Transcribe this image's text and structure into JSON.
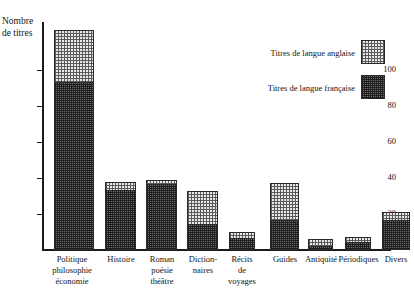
{
  "page": {
    "title_remnant": "· ·· ·· ··"
  },
  "axis_title": {
    "line1": "Nombre",
    "line2": "de titres"
  },
  "legend": {
    "items": [
      {
        "label": "Titres de langue anglaise",
        "key": "english",
        "pattern": "light-checker"
      },
      {
        "label": "Titres de langue française",
        "key": "french",
        "pattern": "dark-crosshatch"
      }
    ]
  },
  "chart_data": {
    "type": "bar",
    "stacked": true,
    "title": "",
    "xlabel": "",
    "ylabel": "Nombre de titres",
    "ylim": [
      0,
      130
    ],
    "yticks": [
      20,
      40,
      60,
      80,
      100
    ],
    "grid": false,
    "legend_position": "top-right",
    "categories": [
      "Politique philosophie économie",
      "Histoire",
      "Roman poésie théâtre",
      "Dictionnaires",
      "Récits de voyages",
      "Guides",
      "Antiquité",
      "Périodiques",
      "Divers"
    ],
    "category_lines": [
      [
        "Politique",
        "philosophie",
        "économie"
      ],
      [
        "Histoire"
      ],
      [
        "Roman",
        "poésie",
        "théâtre"
      ],
      [
        "Diction-",
        "naires"
      ],
      [
        "Récits",
        "de",
        "voyages"
      ],
      [
        "Guides"
      ],
      [
        "Antiquité"
      ],
      [
        "Périodiques"
      ],
      [
        "Divers"
      ]
    ],
    "series": [
      {
        "name": "Titres de langue française",
        "values": [
          94,
          34,
          37,
          15,
          7,
          17,
          3,
          5,
          17
        ]
      },
      {
        "name": "Titres de langue anglaise",
        "values": [
          28,
          4,
          2,
          18,
          3,
          20,
          3,
          2,
          4
        ]
      }
    ],
    "totals": [
      122,
      38,
      39,
      33,
      10,
      37,
      6,
      7,
      21
    ]
  },
  "bars": [
    {
      "name": "politique-philosophie-economie",
      "left": 12,
      "width": 40,
      "fr": 94,
      "en": 28,
      "label_left": -3,
      "label_width": 66
    },
    {
      "name": "histoire",
      "left": 63,
      "width": 31,
      "fr": 34,
      "en": 4,
      "label_left": 56,
      "label_width": 46
    },
    {
      "name": "roman-poesie-theatre",
      "left": 104,
      "width": 31,
      "fr": 37,
      "en": 2,
      "label_left": 97,
      "label_width": 46
    },
    {
      "name": "dictionnaires",
      "left": 145,
      "width": 31,
      "fr": 15,
      "en": 18,
      "label_left": 138,
      "label_width": 46
    },
    {
      "name": "recits-de-voyages",
      "left": 187,
      "width": 26,
      "fr": 7,
      "en": 3,
      "label_left": 177,
      "label_width": 46
    },
    {
      "name": "guides",
      "left": 228,
      "width": 29,
      "fr": 17,
      "en": 20,
      "label_left": 220,
      "label_width": 46
    },
    {
      "name": "antiquite",
      "left": 266,
      "width": 25,
      "fr": 3,
      "en": 3,
      "label_left": 255,
      "label_width": 48
    },
    {
      "name": "periodiques",
      "left": 303,
      "width": 26,
      "fr": 5,
      "en": 2,
      "label_left": 289,
      "label_width": 55
    },
    {
      "name": "divers",
      "left": 340,
      "width": 28,
      "fr": 17,
      "en": 4,
      "label_left": 331,
      "label_width": 46
    }
  ],
  "scale": {
    "baseline_y": 228,
    "px_per_unit": 1.8
  }
}
